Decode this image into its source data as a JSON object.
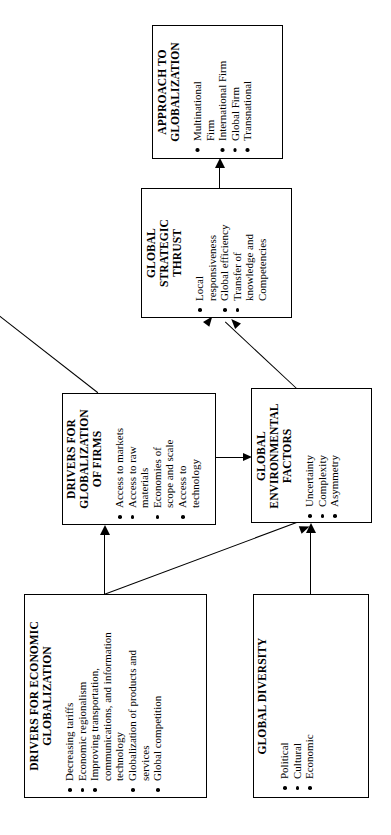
{
  "diagram": {
    "orientation": "rotated-90-ccw",
    "nodes": [
      {
        "id": "approach",
        "title": "APPROACH TO\nGLOBALIZATION",
        "bullets": [
          "Multinational\nFirm",
          "International Firm",
          "Global Firm",
          "Transnational"
        ]
      },
      {
        "id": "thrust",
        "title": "GLOBAL\nSTRATEGIC\nTHRUST",
        "bullets": [
          "Local\nresponsiveness",
          "Global efficiency",
          "Transfer of\nknowledge and\nCompetencies"
        ]
      },
      {
        "id": "drivers-firms",
        "title": "DRIVERS FOR\nGLOBALIZATION\nOF FIRMS",
        "bullets": [
          "Access to markets",
          "Access to raw\nmaterials",
          "Economies of\nscope and scale",
          "Access to\ntechnology"
        ]
      },
      {
        "id": "environmental",
        "title": "GLOBAL\nENVIRONMENTAL\nFACTORS",
        "bullets": [
          "Uncertainty",
          "Complexity",
          "Asymmetry"
        ]
      },
      {
        "id": "drivers-economic",
        "title": "DRIVERS FOR  ECONOMIC\nGLOBALIZATION",
        "bullets": [
          "Decreasing tariffs",
          "Economic regionalism",
          "Improving transportation,\ncommunications, and information\ntechnology",
          "Globalization of products and\nservices",
          "Global competition"
        ]
      },
      {
        "id": "diversity",
        "title": "GLOBAL DIVERSITY",
        "bullets": [
          "Political",
          "Cultural",
          "Economic"
        ]
      }
    ],
    "edges": [
      {
        "from": "thrust",
        "to": "approach"
      },
      {
        "from": "drivers-firms",
        "to": "thrust"
      },
      {
        "from": "environmental",
        "to": "thrust"
      },
      {
        "from": "drivers-firms",
        "to": "environmental"
      },
      {
        "from": "drivers-economic",
        "to": "drivers-firms"
      },
      {
        "from": "drivers-economic",
        "to": "environmental"
      },
      {
        "from": "diversity",
        "to": "environmental"
      }
    ],
    "colors": {
      "stroke": "#000000",
      "background": "#ffffff",
      "text": "#000000"
    }
  }
}
